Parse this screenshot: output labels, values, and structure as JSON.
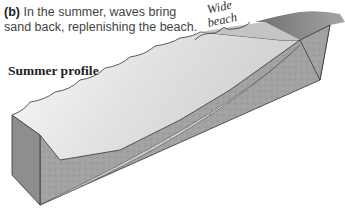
{
  "caption": {
    "letter": "(b)",
    "text": " In the summer, waves bring sand back, replenishing the beach."
  },
  "labels": {
    "profile": "Summer profile",
    "beach_line1": "Wide",
    "beach_line2": "beach"
  },
  "colors": {
    "water_top": "#f4f4f4",
    "water_side": "#a8a8a8",
    "sand": "#cfcfcf",
    "bedrock": "#9a9a9a",
    "land_top": "#8a8a8a",
    "outline": "#333333"
  }
}
